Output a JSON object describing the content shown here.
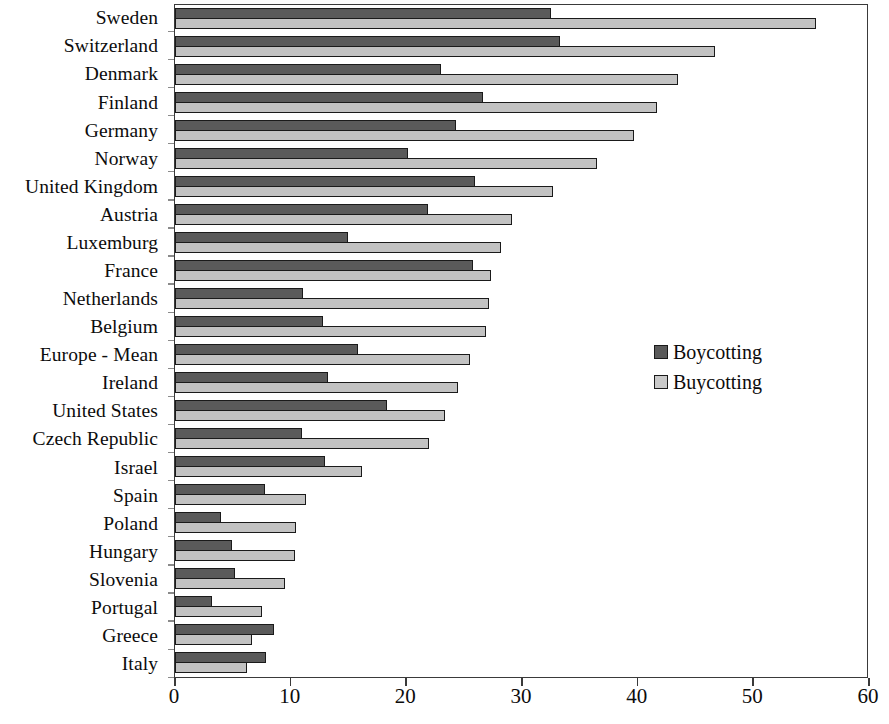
{
  "chart_data": {
    "type": "bar",
    "orientation": "horizontal",
    "title": "",
    "subtitle": "",
    "xlabel": "",
    "ylabel": "",
    "xlim": [
      0,
      60
    ],
    "xticks": [
      0,
      10,
      20,
      30,
      40,
      50,
      60
    ],
    "xtick_labels": [
      "0",
      "10",
      "20",
      "30",
      "40",
      "50",
      "60"
    ],
    "grid": false,
    "legend_position": "center-right",
    "categories": [
      "Sweden",
      "Switzerland",
      "Denmark",
      "Finland",
      "Germany",
      "Norway",
      "United Kingdom",
      "Austria",
      "Luxemburg",
      "France",
      "Netherlands",
      "Belgium",
      "Europe - Mean",
      "Ireland",
      "United States",
      "Czech Republic",
      "Israel",
      "Spain",
      "Poland",
      "Hungary",
      "Slovenia",
      "Portugal",
      "Greece",
      "Italy"
    ],
    "series": [
      {
        "name": "Boycotting",
        "color": "#5a5a5a",
        "values": [
          32.6,
          33.4,
          23.1,
          26.7,
          24.4,
          20.2,
          26.0,
          21.9,
          15.0,
          25.8,
          11.1,
          12.8,
          15.9,
          13.3,
          18.4,
          11.0,
          13.0,
          7.8,
          4.0,
          4.9,
          5.2,
          3.2,
          8.6,
          7.9
        ]
      },
      {
        "name": "Buycotting",
        "color": "#c2c2c2",
        "values": [
          55.6,
          46.8,
          43.6,
          41.8,
          39.8,
          36.6,
          32.8,
          29.2,
          28.3,
          27.4,
          27.2,
          27.0,
          25.6,
          24.5,
          23.4,
          22.0,
          16.2,
          11.4,
          10.5,
          10.4,
          9.5,
          7.5,
          6.7,
          6.2
        ]
      }
    ]
  },
  "legend": {
    "entries": [
      {
        "label": "Boycotting",
        "swatch": "boycott"
      },
      {
        "label": "Buycotting",
        "swatch": "buycott"
      }
    ]
  }
}
